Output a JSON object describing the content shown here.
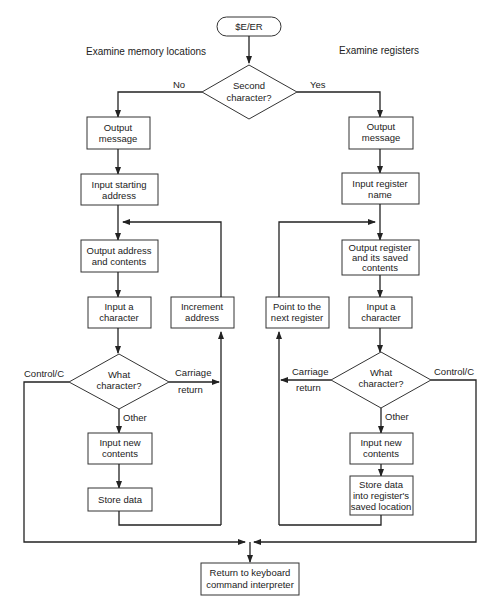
{
  "diagram": {
    "start": "$E/ER",
    "section_left": "Examine memory locations",
    "section_right": "Examine registers",
    "decision_top": {
      "line1": "Second",
      "line2": "character?",
      "no": "No",
      "yes": "Yes"
    },
    "left": {
      "output_message": [
        "Output",
        "message"
      ],
      "input_start": [
        "Input starting",
        "address"
      ],
      "output_addr": [
        "Output address",
        "and contents"
      ],
      "input_char": [
        "Input a",
        "character"
      ],
      "increment": [
        "Increment",
        "address"
      ],
      "decision": [
        "What",
        "character?"
      ],
      "ctrl_c": "Control/C",
      "cr1": "Carriage",
      "cr2": "return",
      "other": "Other",
      "input_new": [
        "Input new",
        "contents"
      ],
      "store": "Store data"
    },
    "right": {
      "output_message": [
        "Output",
        "message"
      ],
      "input_reg": [
        "Input register",
        "name"
      ],
      "output_reg": [
        "Output register",
        "and its saved",
        "contents"
      ],
      "input_char": [
        "Input a",
        "character"
      ],
      "point_next": [
        "Point to the",
        "next register"
      ],
      "decision": [
        "What",
        "character?"
      ],
      "ctrl_c": "Control/C",
      "cr1": "Carriage",
      "cr2": "return",
      "other": "Other",
      "input_new": [
        "Input new",
        "contents"
      ],
      "store": [
        "Store data",
        "into register's",
        "saved location"
      ]
    },
    "end": [
      "Return to keyboard",
      "command interpreter"
    ]
  }
}
